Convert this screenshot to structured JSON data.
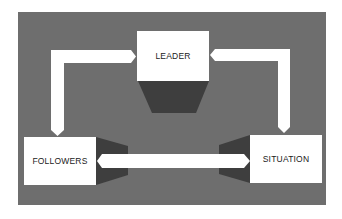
{
  "diagram": {
    "type": "relationship-triangle",
    "background_color": "#6e6e6e",
    "node_color": "#ffffff",
    "shadow_color": "#3e3e3e",
    "arrow_color": "#ffffff",
    "nodes": {
      "leader": "LEADER",
      "followers": "FOLLOWERS",
      "situation": "SITUATION"
    },
    "connections": [
      {
        "from": "leader",
        "to": "followers",
        "style": "bidirectional-elbow-arrow"
      },
      {
        "from": "leader",
        "to": "situation",
        "style": "bidirectional-elbow-arrow"
      },
      {
        "from": "followers",
        "to": "situation",
        "style": "bidirectional-straight-arrow"
      }
    ]
  }
}
